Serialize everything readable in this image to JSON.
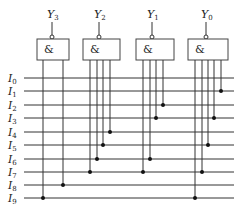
{
  "diagram": {
    "type": "AND-array encoder (diode/gate matrix)",
    "inputs": [
      {
        "name": "I",
        "sub": "0",
        "y": 78
      },
      {
        "name": "I",
        "sub": "1",
        "y": 91
      },
      {
        "name": "I",
        "sub": "2",
        "y": 105
      },
      {
        "name": "I",
        "sub": "3",
        "y": 118
      },
      {
        "name": "I",
        "sub": "4",
        "y": 132
      },
      {
        "name": "I",
        "sub": "5",
        "y": 145
      },
      {
        "name": "I",
        "sub": "6",
        "y": 159
      },
      {
        "name": "I",
        "sub": "7",
        "y": 172
      },
      {
        "name": "I",
        "sub": "8",
        "y": 185
      },
      {
        "name": "I",
        "sub": "9",
        "y": 198
      }
    ],
    "line_x_start": 24,
    "line_x_end": 234,
    "gates": [
      {
        "output": "Y",
        "sub": "3",
        "symbol": "&",
        "box": {
          "x": 37,
          "y": 39,
          "w": 32,
          "h": 21
        },
        "out_x": 52,
        "taps": [
          {
            "x": 43,
            "input": 9
          },
          {
            "x": 63,
            "input": 8
          }
        ]
      },
      {
        "output": "Y",
        "sub": "2",
        "symbol": "&",
        "box": {
          "x": 83,
          "y": 39,
          "w": 37,
          "h": 21
        },
        "out_x": 99,
        "taps": [
          {
            "x": 90,
            "input": 7
          },
          {
            "x": 97,
            "input": 6
          },
          {
            "x": 103,
            "input": 5
          },
          {
            "x": 110,
            "input": 4
          }
        ]
      },
      {
        "output": "Y",
        "sub": "1",
        "symbol": "&",
        "box": {
          "x": 136,
          "y": 39,
          "w": 38,
          "h": 21
        },
        "out_x": 152,
        "taps": [
          {
            "x": 143,
            "input": 7
          },
          {
            "x": 150,
            "input": 6
          },
          {
            "x": 156,
            "input": 3
          },
          {
            "x": 163,
            "input": 2
          }
        ]
      },
      {
        "output": "Y",
        "sub": "0",
        "symbol": "&",
        "box": {
          "x": 188,
          "y": 39,
          "w": 40,
          "h": 21
        },
        "out_x": 206,
        "taps": [
          {
            "x": 195,
            "input": 9
          },
          {
            "x": 202,
            "input": 7
          },
          {
            "x": 208,
            "input": 5
          },
          {
            "x": 214,
            "input": 3
          },
          {
            "x": 221,
            "input": 1
          }
        ]
      }
    ],
    "colors": {
      "line": "#333333",
      "box": "#444444",
      "dot": "#111111",
      "background": "#ffffff"
    }
  }
}
